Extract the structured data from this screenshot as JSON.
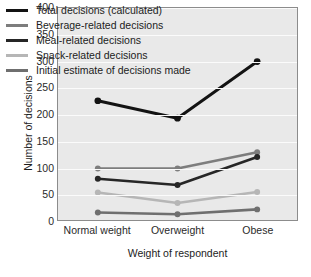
{
  "chart_data": {
    "type": "line",
    "title": "",
    "xlabel": "Weight of respondent",
    "ylabel": "Number of decisions",
    "categories": [
      "Normal weight",
      "Overweight",
      "Obese"
    ],
    "ylim": [
      0,
      400
    ],
    "yticks": [
      0,
      50,
      100,
      150,
      200,
      250,
      300,
      350,
      400
    ],
    "ytick_labels": [
      "0",
      "50",
      "100",
      "150",
      "200",
      "250",
      "300",
      "350",
      "400"
    ],
    "grid": "horizontal",
    "legend_position": "upper-left-inside",
    "plot_background": "#e9e9e9",
    "gridline_color": "#fbfbfb",
    "series": [
      {
        "name": "Total decisions (calculated)",
        "color": "#131313",
        "width": 3.0,
        "marker": "circle",
        "values": [
          225,
          192,
          299
        ]
      },
      {
        "name": "Beverage-related decisions",
        "color": "#7d7d7d",
        "width": 2.6,
        "marker": "circle",
        "values": [
          97,
          97,
          128
        ]
      },
      {
        "name": "Meal-related decisions",
        "color": "#262626",
        "width": 2.6,
        "marker": "circle",
        "values": [
          78,
          66,
          119
        ]
      },
      {
        "name": "Snack-related decisions",
        "color": "#b6b6b6",
        "width": 2.6,
        "marker": "circle",
        "values": [
          52,
          32,
          53
        ]
      },
      {
        "name": "Initial estimate of decisions made",
        "color": "#6f6f6f",
        "width": 2.6,
        "marker": "circle",
        "values": [
          14,
          11,
          20
        ]
      }
    ]
  }
}
